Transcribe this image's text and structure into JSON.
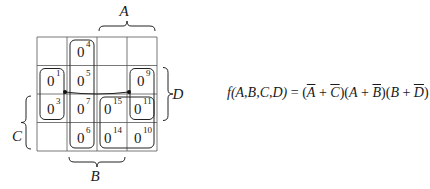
{
  "kmap": {
    "grid": {
      "x": 37,
      "y": 37,
      "cell_w": 30,
      "cell_h": 28.5,
      "rows": 4,
      "cols": 4
    },
    "cells": [
      [
        null,
        {
          "value": "0",
          "index": "4"
        },
        null,
        null
      ],
      [
        {
          "value": "0",
          "index": "1"
        },
        {
          "value": "0",
          "index": "5"
        },
        null,
        {
          "value": "0",
          "index": "9"
        }
      ],
      [
        {
          "value": "0",
          "index": "3"
        },
        {
          "value": "0",
          "index": "7"
        },
        {
          "value": "0",
          "index": "15"
        },
        {
          "value": "0",
          "index": "11"
        }
      ],
      [
        null,
        {
          "value": "0",
          "index": "6"
        },
        {
          "value": "0",
          "index": "14"
        },
        {
          "value": "0",
          "index": "10"
        }
      ]
    ],
    "groups": [
      {
        "name": "group-B-bar",
        "col": 1,
        "row": 0,
        "cols": 1,
        "rows": 4
      },
      {
        "name": "group-left-wrap",
        "col": 0,
        "row": 1,
        "cols": 1,
        "rows": 2
      },
      {
        "name": "group-right-wrap",
        "col": 3,
        "row": 1,
        "cols": 1,
        "rows": 2
      },
      {
        "name": "group-A-C-block",
        "col": 2,
        "row": 2,
        "cols": 2,
        "rows": 2
      }
    ],
    "labels": {
      "A": "A",
      "B": "B",
      "C": "C",
      "D": "D"
    }
  },
  "formula": {
    "lhs": "f(A,B,C,D)",
    "equals": " = ",
    "terms": [
      {
        "parts": [
          {
            "text": "A",
            "bar": true
          },
          {
            "text": " + "
          },
          {
            "text": "C",
            "bar": true
          }
        ]
      },
      {
        "parts": [
          {
            "text": "A",
            "bar": false
          },
          {
            "text": " + "
          },
          {
            "text": "B",
            "bar": true
          }
        ]
      },
      {
        "parts": [
          {
            "text": "B",
            "bar": false
          },
          {
            "text": " + "
          },
          {
            "text": "D",
            "bar": true
          }
        ]
      }
    ],
    "full_text": "f(A,B,C,D) = (Ā + C̄)(A + B̄)(B + D̄)"
  }
}
